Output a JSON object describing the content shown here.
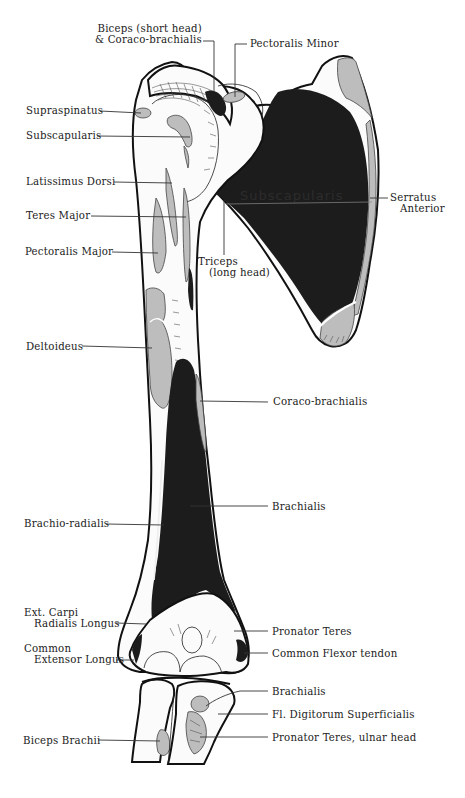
{
  "figure": {
    "embedded_text": "Subscapularis",
    "colors": {
      "background": "#ffffff",
      "bone": "#fbfbfb",
      "outline": "#111111",
      "dark_attachment": "#1c1c1c",
      "gray_attachment": "#bdbdbd"
    }
  },
  "labels": {
    "biceps_short_head": {
      "line1": "Biceps (short head)",
      "line2": "& Coraco-brachialis"
    },
    "pectoralis_minor": "Pectoralis Minor",
    "supraspinatus": "Supraspinatus",
    "subscapularis": "Subscapularis",
    "latissimus_dorsi": "Latissimus Dorsi",
    "teres_major": "Teres Major",
    "pectoralis_major": "Pectoralis Major",
    "triceps_long_head": {
      "line1": "Triceps",
      "line2": "(long head)"
    },
    "serratus_anterior": {
      "line1": "Serratus",
      "line2": "Anterior"
    },
    "deltoideus": "Deltoideus",
    "coraco_brachialis": "Coraco-brachialis",
    "brachialis_shaft": "Brachialis",
    "brachio_radialis": "Brachio-radialis",
    "ext_carpi_radialis_longus": {
      "line1": "Ext. Carpi",
      "line2": "Radialis Longus"
    },
    "pronator_teres": "Pronator Teres",
    "common_extensor_longus": {
      "line1": "Common",
      "line2": "Extensor Longus"
    },
    "common_flexor_tendon": "Common Flexor tendon",
    "brachialis_ulna": "Brachialis",
    "fl_digitorum_superficialis": "Fl. Digitorum Superficialis",
    "biceps_brachii": "Biceps Brachii",
    "pronator_teres_ulnar_head": "Pronator Teres, ulnar head"
  }
}
